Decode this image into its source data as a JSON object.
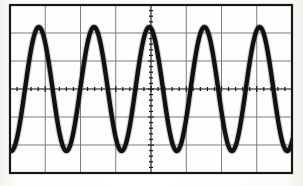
{
  "scope": {
    "title": "Oscilloscope display photograph",
    "display_type": "analog-crt-graticule",
    "graticule": {
      "left_px": 10,
      "top_px": 5,
      "right_px": 292,
      "bottom_px": 173,
      "horizontal_divisions": 8,
      "vertical_divisions": 6,
      "division_width_px": 35.25,
      "division_height_px": 28.0,
      "subdivisions_per_division": 5,
      "center_x_px": 151,
      "center_y_px": 89,
      "border_color": "#1a1a1a",
      "grid_color": "#7d7d7d",
      "background_color": "#fefefe",
      "tick_color": "#222222",
      "tick_length_px": 5,
      "center_axes_have_ticks": true
    },
    "trace": {
      "waveform": "sine",
      "color": "#111111",
      "line_width_px": 4.4,
      "cycles_visible": 5.1,
      "period_px": 55.2,
      "period_divisions": 1.566,
      "amplitude_px": 62,
      "amplitude_divisions": 2.21,
      "peak_to_peak_divisions": 4.43,
      "baseline_y_px": 89,
      "peak_y_px": 27,
      "trough_y_px": 151,
      "phase_offset_px": 25,
      "peak_x_positions_px": [
        25,
        80,
        135,
        190,
        245
      ],
      "trough_x_positions_px": [
        52,
        107,
        162,
        217,
        272
      ]
    }
  },
  "chart_data": {
    "type": "line",
    "xlabel": "Time (divisions)",
    "ylabel": "Amplitude (divisions)",
    "xlim": [
      -4,
      4
    ],
    "ylim": [
      -3,
      3
    ],
    "grid": true,
    "legend": "none",
    "xticks": [
      -4,
      -3,
      -2,
      -1,
      0,
      1,
      2,
      3,
      4
    ],
    "yticks": [
      -3,
      -2,
      -1,
      0,
      1,
      2,
      3
    ],
    "minor_ticks_per_division": 5,
    "series": [
      {
        "name": "sine trace",
        "function": "y = 2.21 * sin(2*pi*(x + 3.57)/1.566)",
        "amplitude_div": 2.21,
        "period_div": 1.566,
        "frequency_cycles_per_screen": 5.1,
        "phase_deg": 0,
        "color": "#111111"
      }
    ],
    "annotations": []
  }
}
